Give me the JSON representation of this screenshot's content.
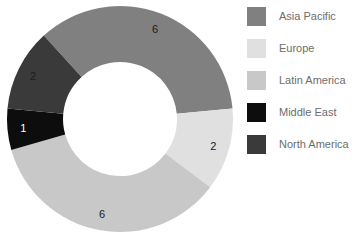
{
  "chart_data": {
    "type": "pie",
    "variant": "donut",
    "title": "",
    "xlabel": "",
    "ylabel": "",
    "categories": [
      "Asia Pacific",
      "Europe",
      "Latin America",
      "Middle East",
      "North America"
    ],
    "values": [
      6,
      2,
      6,
      1,
      2
    ],
    "total": 17,
    "labels_shown": [
      "6",
      "2",
      "6",
      "1",
      "2"
    ],
    "colors": [
      "#808080",
      "#e0e0e0",
      "#c8c8c8",
      "#0d0d0d",
      "#3a3a3a"
    ],
    "label_text_colors": [
      "#1a1a1a",
      "#1a1a1a",
      "#1a1a1a",
      "#ffffff",
      "#1a1a1a"
    ],
    "slices": [
      {
        "name": "Asia Pacific",
        "value": 6,
        "label": "6",
        "color": "#808080",
        "label_color": "#1a1a1a",
        "start_angle": -42.4,
        "end_angle": 84.7
      },
      {
        "name": "Europe",
        "value": 2,
        "label": "2",
        "color": "#e0e0e0",
        "label_color": "#1a1a1a",
        "start_angle": 84.7,
        "end_angle": 127.1
      },
      {
        "name": "Latin America",
        "value": 6,
        "label": "6",
        "color": "#c8c8c8",
        "label_color": "#1a1a1a",
        "start_angle": 127.1,
        "end_angle": 254.1
      },
      {
        "name": "Middle East",
        "value": 1,
        "label": "1",
        "color": "#0d0d0d",
        "label_color": "#ffffff",
        "start_angle": 254.1,
        "end_angle": 275.3
      },
      {
        "name": "North America",
        "value": 2,
        "label": "2",
        "color": "#3a3a3a",
        "label_color": "#1a1a1a",
        "start_angle": 275.3,
        "end_angle": 317.6
      }
    ],
    "legend": {
      "position": "right",
      "entries": [
        {
          "label": "Asia Pacific",
          "color": "#808080"
        },
        {
          "label": "Europe",
          "color": "#e0e0e0"
        },
        {
          "label": "Latin America",
          "color": "#c8c8c8"
        },
        {
          "label": "Middle East",
          "color": "#0d0d0d"
        },
        {
          "label": "North America",
          "color": "#3a3a3a"
        }
      ]
    },
    "geometry": {
      "center_x": 120,
      "center_y": 119,
      "outer_radius": 113,
      "inner_radius": 57
    },
    "grid": false,
    "background": "#ffffff"
  }
}
